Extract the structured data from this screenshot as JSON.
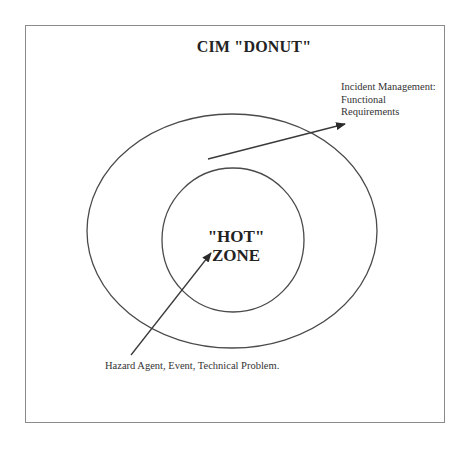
{
  "diagram": {
    "title": "CIM \"DONUT\"",
    "outer_ring_label": {
      "lines": [
        "Incident Management:",
        "Functional",
        "Requirements"
      ]
    },
    "inner_zone_label": {
      "lines": [
        "\"HOT\"",
        "ZONE"
      ]
    },
    "inner_arrow_label": "Hazard Agent, Event, Technical Problem.",
    "colors": {
      "stroke": "#4a4a4a",
      "frame": "#8a8a8a",
      "text": "#222222",
      "background": "#ffffff"
    },
    "shapes": {
      "outer_ellipse": {
        "cx": 232,
        "cy": 231,
        "rx": 145,
        "ry": 117
      },
      "inner_ellipse": {
        "cx": 233,
        "cy": 240,
        "rx": 71,
        "ry": 72
      }
    }
  }
}
